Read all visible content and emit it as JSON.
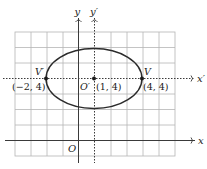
{
  "figure": {
    "type": "ellipse-translated-axes",
    "colors": {
      "grid": "#b5b5b5",
      "axis": "#3a3a3a",
      "curve": "#2a2a2a",
      "point": "#1a1a1a",
      "text": "#222222",
      "background": "#ffffff"
    },
    "axes": {
      "x_label": "x",
      "y_label": "y",
      "origin_label": "O",
      "x_prime_label": "x′",
      "y_prime_label": "y′"
    },
    "grid": {
      "columns": 10,
      "rows": 8,
      "x_range": [
        -4,
        6
      ],
      "y_range": [
        -1,
        7
      ]
    },
    "ellipse": {
      "center": [
        1,
        4
      ],
      "semi_major_x": 3,
      "semi_minor_y": 2
    },
    "points": [
      {
        "name": "V′",
        "coord_label": "(−2, 4)",
        "x": -2,
        "y": 4
      },
      {
        "name": "O′",
        "coord_label": "(1, 4)",
        "x": 1,
        "y": 4
      },
      {
        "name": "V",
        "coord_label": "(4, 4)",
        "x": 4,
        "y": 4
      }
    ]
  }
}
